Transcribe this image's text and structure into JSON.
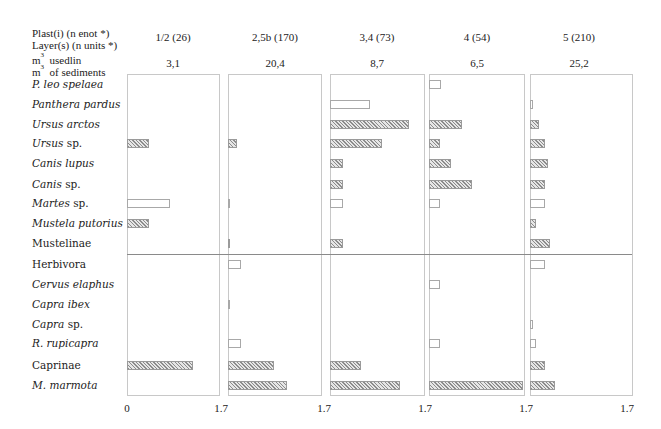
{
  "header": {
    "line1": "Plast(i) (n enot *)",
    "line2": "Layer(s) (n units *)",
    "line3_m": "m",
    "line3_sup": "3",
    "line3_text": "usedlin",
    "line4_m": "m",
    "line4_sup": "3",
    "line4_text": "of sediments"
  },
  "columns": [
    {
      "layer": "1/2 (26)",
      "volume": "3,1"
    },
    {
      "layer": "2,5b (170)",
      "volume": "20,4"
    },
    {
      "layer": "3,4 (73)",
      "volume": "8,7"
    },
    {
      "layer": "4 (54)",
      "volume": "6,5"
    },
    {
      "layer": "5 (210)",
      "volume": "25,2"
    }
  ],
  "rows": [
    {
      "name": "P. leo spelaea",
      "italic": true
    },
    {
      "name": "Panthera pardus",
      "italic": true
    },
    {
      "name": "Ursus arctos",
      "italic": true
    },
    {
      "name": "Ursus",
      "suffix": " sp.",
      "italic": true
    },
    {
      "name": "Canis lupus",
      "italic": true
    },
    {
      "name": "Canis",
      "suffix": " sp.",
      "italic": true
    },
    {
      "name": "Martes",
      "suffix": " sp.",
      "italic": true
    },
    {
      "name": "Mustela putorius",
      "italic": true
    },
    {
      "name": "Mustelinae",
      "italic": false
    },
    {
      "name": "Herbivora",
      "italic": false
    },
    {
      "name": "Cervus elaphus",
      "italic": true
    },
    {
      "name": "Capra ibex",
      "italic": true
    },
    {
      "name": "Capra",
      "suffix": " sp.",
      "italic": true
    },
    {
      "name": "R. rupicapra",
      "italic": true
    },
    {
      "name": "Caprinae",
      "italic": false
    },
    {
      "name": "M. marmota",
      "italic": true
    }
  ],
  "axis": {
    "ticks": [
      "0",
      "1.7",
      "1.7",
      "1.7",
      "1.7",
      "1.7"
    ]
  },
  "chart_data": {
    "type": "bar",
    "orientation": "horizontal",
    "title": "",
    "xlabel": "",
    "ylabel": "",
    "xlim": [
      0,
      1.7
    ],
    "grid": false,
    "legend": "none (hatched = filled bar, white = open bar)",
    "categories": [
      "P. leo spelaea",
      "Panthera pardus",
      "Ursus arctos",
      "Ursus sp.",
      "Canis lupus",
      "Canis sp.",
      "Martes sp.",
      "Mustela putorius",
      "Mustelinae",
      "Herbivora",
      "Cervus elaphus",
      "Capra ibex",
      "Capra sp.",
      "R. rupicapra",
      "Caprinae",
      "M. marmota"
    ],
    "group_separator_after": "Mustelinae",
    "series": [
      {
        "name": "1/2 (26)",
        "volume_m3": "3,1",
        "values": [
          0,
          0,
          0,
          0.4,
          0,
          0,
          0.78,
          0.4,
          0,
          0,
          0,
          0,
          0,
          0,
          1.2,
          0
        ],
        "style": [
          "",
          "",
          "",
          "hatch",
          "",
          "",
          "open",
          "hatch",
          "",
          "",
          "",
          "",
          "",
          "",
          "hatch",
          ""
        ]
      },
      {
        "name": "2,5b (170)",
        "volume_m3": "20,4",
        "values": [
          0,
          0,
          0,
          0.16,
          0,
          0,
          0.04,
          0,
          0.04,
          0.24,
          0,
          0.04,
          0,
          0.24,
          0.84,
          1.07
        ],
        "style": [
          "",
          "",
          "",
          "hatch",
          "",
          "",
          "open",
          "",
          "hatch",
          "open",
          "",
          "open",
          "",
          "open",
          "hatch",
          "hatch"
        ]
      },
      {
        "name": "3,4 (73)",
        "volume_m3": "8,7",
        "values": [
          0,
          0.72,
          1.42,
          0.94,
          0.23,
          0.23,
          0.23,
          0,
          0.23,
          0,
          0,
          0,
          0,
          0,
          0.56,
          1.26
        ],
        "style": [
          "",
          "open",
          "hatch",
          "hatch",
          "hatch",
          "hatch",
          "open",
          "",
          "hatch",
          "",
          "",
          "",
          "",
          "",
          "hatch",
          "hatch"
        ]
      },
      {
        "name": "4 (54)",
        "volume_m3": "6,5",
        "values": [
          0.22,
          0,
          0.59,
          0.2,
          0.4,
          0.77,
          0.2,
          0,
          0,
          0,
          0.2,
          0,
          0,
          0.2,
          0,
          1.7
        ],
        "style": [
          "open",
          "",
          "hatch",
          "hatch",
          "hatch",
          "hatch",
          "open",
          "",
          "",
          "",
          "open",
          "",
          "",
          "open",
          "",
          "hatch"
        ]
      },
      {
        "name": "5 (210)",
        "volume_m3": "25,2",
        "values": [
          0,
          0.05,
          0.16,
          0.27,
          0.32,
          0.27,
          0.27,
          0.11,
          0.37,
          0.27,
          0,
          0,
          0.05,
          0.11,
          0.27,
          0.46
        ],
        "style": [
          "",
          "open",
          "hatch",
          "hatch",
          "hatch",
          "hatch",
          "open",
          "hatch",
          "hatch",
          "open",
          "",
          "",
          "open",
          "open",
          "hatch",
          "hatch"
        ]
      }
    ]
  }
}
